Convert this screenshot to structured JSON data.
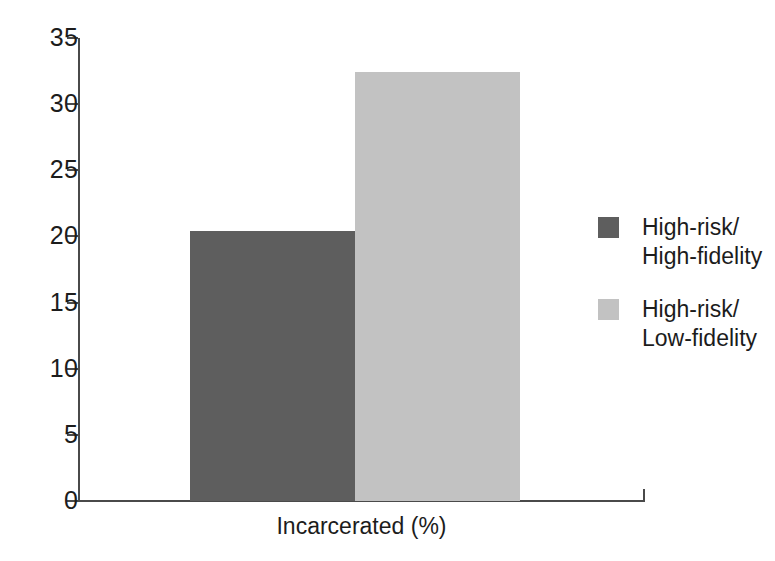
{
  "chart_data": {
    "type": "bar",
    "title": "",
    "subtitle": "",
    "xlabel": "Incarcerated (%)",
    "ylabel": "",
    "categories": [
      "Incarcerated (%)"
    ],
    "ylim": [
      0,
      35
    ],
    "yticks": [
      0,
      5,
      10,
      15,
      20,
      25,
      30,
      35
    ],
    "ytick_labels": [
      "0",
      "5",
      "10",
      "15",
      "20",
      "25",
      "30",
      "35"
    ],
    "grid": false,
    "legend_position": "right",
    "series": [
      {
        "name": "High-risk/\nHigh-fidelity",
        "values": [
          20.4
        ],
        "color": "#5e5e5e"
      },
      {
        "name": "High-risk/\nLow-fidelity",
        "values": [
          32.4
        ],
        "color": "#c2c2c2"
      }
    ],
    "annotations": []
  },
  "axes": {
    "y_ticks": [
      {
        "label": "35",
        "value": 35
      },
      {
        "label": "30",
        "value": 30
      },
      {
        "label": "25",
        "value": 25
      },
      {
        "label": "20",
        "value": 20
      },
      {
        "label": "15",
        "value": 15
      },
      {
        "label": "10",
        "value": 10
      },
      {
        "label": "5",
        "value": 5
      },
      {
        "label": "0",
        "value": 0
      }
    ],
    "x_title": "Incarcerated (%)"
  },
  "legend": {
    "items": [
      {
        "label": "High-risk/\nHigh-fidelity",
        "color": "#5e5e5e"
      },
      {
        "label": "High-risk/\nLow-fidelity",
        "color": "#c2c2c2"
      }
    ]
  },
  "colors": {
    "axis": "#4a4a4a",
    "text": "#1c1c1c",
    "background": "#ffffff",
    "series_dark": "#5e5e5e",
    "series_light": "#c2c2c2"
  }
}
